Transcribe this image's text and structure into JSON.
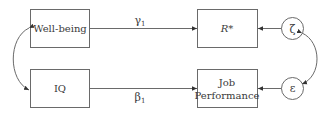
{
  "diagram": {
    "type": "path-model",
    "nodes": [
      {
        "id": "wellbeing",
        "label": "Well-being",
        "shape": "rect"
      },
      {
        "id": "iq",
        "label": "IQ",
        "shape": "rect"
      },
      {
        "id": "rstar",
        "label": "R*",
        "shape": "rect"
      },
      {
        "id": "jobperf",
        "label_line1": "Job",
        "label_line2": "Performance",
        "shape": "rect"
      },
      {
        "id": "zeta",
        "label": "ζ",
        "shape": "circle"
      },
      {
        "id": "epsilon",
        "label": "ε",
        "shape": "circle"
      }
    ],
    "edges": [
      {
        "from": "wellbeing",
        "to": "rstar",
        "label": "γ",
        "subscript": "1"
      },
      {
        "from": "iq",
        "to": "jobperf",
        "label": "β",
        "subscript": "1"
      },
      {
        "from": "zeta",
        "to": "rstar"
      },
      {
        "from": "epsilon",
        "to": "jobperf"
      },
      {
        "from": "wellbeing",
        "to": "iq",
        "bidirectional": true
      },
      {
        "from": "zeta",
        "to": "epsilon",
        "bidirectional": true
      }
    ],
    "colors": {
      "stroke": "#6a6a6a",
      "text": "#3a3a3a",
      "background": "#ffffff"
    }
  }
}
